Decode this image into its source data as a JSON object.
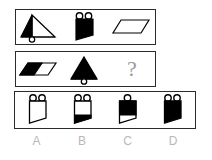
{
  "puzzle": {
    "type": "visual-analogy-matrix",
    "rows": [
      {
        "name": "row-1",
        "cells": [
          {
            "shape": "triangle",
            "fill": "left-half-black",
            "marker": "one-circle-bottom",
            "label": "triangle with left half filled, circle below"
          },
          {
            "shape": "banner",
            "fill": "all-black",
            "marker": "two-circles-top",
            "label": "black banner with two circles on top"
          },
          {
            "shape": "parallelogram",
            "fill": "white",
            "marker": "none",
            "label": "white parallelogram"
          }
        ]
      },
      {
        "name": "row-2",
        "cells": [
          {
            "shape": "parallelogram",
            "fill": "left-half-black",
            "marker": "none",
            "label": "parallelogram with left half filled"
          },
          {
            "shape": "triangle",
            "fill": "all-black",
            "marker": "one-circle-bottom",
            "label": "black triangle with circle below"
          },
          {
            "shape": "question",
            "fill": "none",
            "marker": "none",
            "label": "?"
          }
        ]
      }
    ],
    "options": [
      {
        "letter": "A",
        "shape": "banner",
        "fill": "white",
        "marker": "two-circles-top",
        "label": "white banner with two circles"
      },
      {
        "letter": "B",
        "shape": "banner",
        "fill": "bottom-black",
        "marker": "two-circles-top",
        "label": "banner with black lower triangle"
      },
      {
        "letter": "C",
        "shape": "banner",
        "fill": "top-black",
        "marker": "one-circle-top",
        "label": "banner with black upper part, one circle"
      },
      {
        "letter": "D",
        "shape": "banner",
        "fill": "all-black",
        "marker": "two-circles-top",
        "label": "black banner with two circles"
      }
    ],
    "question_mark": "?",
    "colors": {
      "ink": "#000000",
      "border": "#2b2b2b",
      "label": "#b9b9b9",
      "question": "#9a9a9a",
      "background": "#ffffff"
    }
  }
}
